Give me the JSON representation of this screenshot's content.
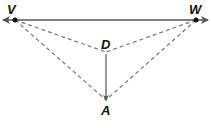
{
  "diagram": {
    "colors": {
      "line": "#555555",
      "dashed": "#777777",
      "point": "#111111",
      "label": "#111111"
    },
    "points": {
      "V": {
        "label": "V",
        "x": 15,
        "y": 20
      },
      "W": {
        "label": "W",
        "x": 196,
        "y": 20
      },
      "D": {
        "label": "D",
        "x": 106,
        "y": 52
      },
      "A": {
        "label": "A",
        "x": 106,
        "y": 100
      }
    },
    "lines": [
      {
        "from": "V",
        "to": "W",
        "style": "solid",
        "arrows": "both",
        "description": "line VW"
      },
      {
        "from": "D",
        "to": "A",
        "style": "solid",
        "arrows": "end",
        "description": "ray DA"
      },
      {
        "from": "V",
        "to": "D",
        "style": "dashed"
      },
      {
        "from": "W",
        "to": "D",
        "style": "dashed"
      },
      {
        "from": "V",
        "to": "A",
        "style": "dashed"
      },
      {
        "from": "W",
        "to": "A",
        "style": "dashed"
      }
    ]
  }
}
